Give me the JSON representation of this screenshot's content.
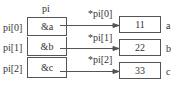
{
  "array": {
    "title": "pi",
    "rows": [
      {
        "label": "pi[0]",
        "value": "&a",
        "deref": "*pi[0]",
        "target_value": "11",
        "target_name": "a"
      },
      {
        "label": "pi[1]",
        "value": "&b",
        "deref": "*pi[1]",
        "target_value": "22",
        "target_name": "b"
      },
      {
        "label": "pi[2]",
        "value": "&c",
        "deref": "*pi[2]",
        "target_value": "33",
        "target_name": "c"
      }
    ]
  },
  "colors": {
    "line": "#555555",
    "text": "#333333"
  }
}
